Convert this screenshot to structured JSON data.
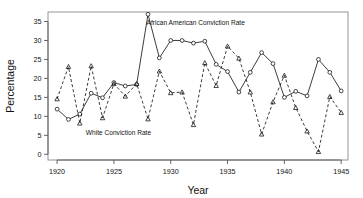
{
  "chart_data": {
    "type": "line",
    "title": "",
    "xlabel": "Year",
    "ylabel": "Percentage",
    "xlim": [
      1919.2,
      1945.6
    ],
    "ylim": [
      -1.5,
      37.5
    ],
    "xticks": [
      1920,
      1925,
      1930,
      1935,
      1940,
      1945
    ],
    "yticks": [
      0,
      5,
      10,
      15,
      20,
      25,
      30,
      35
    ],
    "grid": false,
    "legend_position": "inline-annotations",
    "annotations": [
      {
        "text": "African American Conviction Rate",
        "x": 1932.2,
        "y": 34.0
      },
      {
        "text": "White Conviction Rate",
        "x": 1925.4,
        "y": 5.2
      }
    ],
    "x": [
      1920,
      1921,
      1922,
      1923,
      1924,
      1925,
      1926,
      1927,
      1928,
      1929,
      1930,
      1931,
      1932,
      1933,
      1934,
      1935,
      1936,
      1937,
      1938,
      1939,
      1940,
      1941,
      1942,
      1943,
      1944,
      1945
    ],
    "series": [
      {
        "name": "African American Conviction Rate",
        "marker": "circle",
        "linestyle": "solid",
        "values": [
          11.9,
          9.2,
          10.6,
          16.1,
          14.9,
          18.9,
          18.0,
          18.4,
          36.9,
          25.4,
          30.0,
          30.0,
          29.3,
          29.8,
          23.7,
          21.8,
          16.4,
          21.6,
          26.8,
          23.9,
          15.0,
          16.6,
          15.4,
          25.0,
          21.6,
          16.7
        ]
      },
      {
        "name": "White Conviction Rate",
        "marker": "triangle",
        "linestyle": "dashed",
        "values": [
          14.6,
          23.1,
          8.2,
          23.3,
          9.6,
          18.6,
          15.3,
          18.6,
          9.3,
          21.9,
          16.2,
          16.4,
          7.8,
          24.1,
          18.1,
          28.5,
          25.3,
          16.4,
          5.3,
          13.8,
          20.8,
          12.3,
          6.1,
          0.7,
          15.2,
          11.0
        ]
      }
    ]
  },
  "axes": {
    "x_title": "Year",
    "y_title": "Percentage",
    "x_tick_labels": [
      "1920",
      "1925",
      "1930",
      "1935",
      "1940",
      "1945"
    ],
    "y_tick_labels": [
      "0",
      "5",
      "10",
      "15",
      "20",
      "25",
      "30",
      "35"
    ]
  },
  "labels": {
    "african_american": "African American Conviction Rate",
    "white": "White Conviction Rate"
  },
  "colors": {
    "line": "#1a1a1a",
    "frame": "#8a8a8a",
    "background": "#ffffff",
    "text": "#111111"
  }
}
